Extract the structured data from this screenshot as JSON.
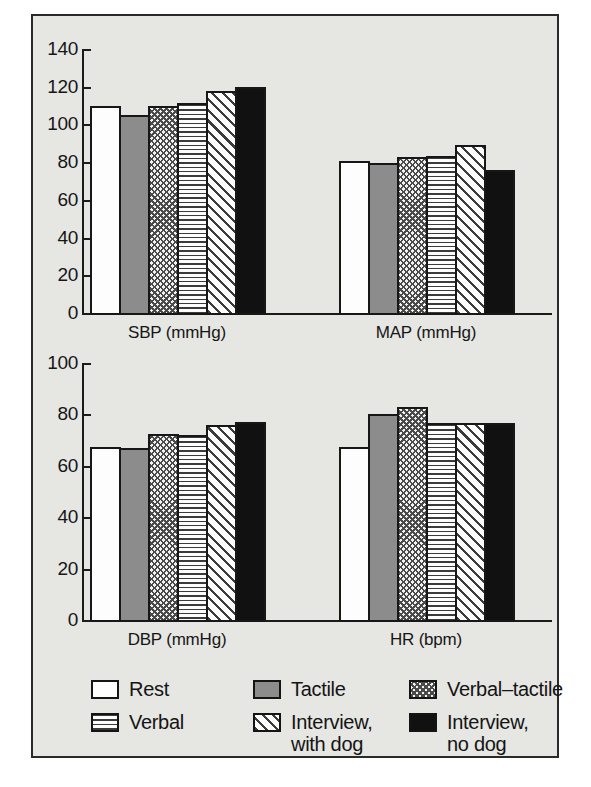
{
  "chart_data": {
    "type": "bar",
    "title": "",
    "subtitle": "",
    "grid": false,
    "legend_position": "bottom",
    "series": [
      {
        "name": "Rest",
        "pattern": "solid-white",
        "values": [
          110,
          80.5,
          67.5,
          67.5
        ]
      },
      {
        "name": "Tactile",
        "pattern": "grey",
        "values": [
          105,
          79.5,
          67,
          80
        ]
      },
      {
        "name": "Verbal–tactile",
        "pattern": "checker",
        "values": [
          110,
          82.5,
          72.5,
          83
        ]
      },
      {
        "name": "Verbal",
        "pattern": "hlines",
        "values": [
          111.5,
          83,
          72,
          76.5
        ]
      },
      {
        "name": "Interview,\nwith dog",
        "pattern": "diagonal",
        "values": [
          117.5,
          89,
          76,
          76.5
        ]
      },
      {
        "name": "Interview,\nno dog",
        "pattern": "black",
        "values": [
          120,
          76,
          77,
          76.5
        ]
      }
    ],
    "panels": [
      {
        "id": "sbp",
        "xlabel": "SBP (mmHg)",
        "ylabel": "",
        "ylim": [
          0,
          140
        ],
        "yticks": [
          "0",
          "20",
          "40",
          "60",
          "80",
          "100",
          "120",
          "140"
        ],
        "categories": [
          "Rest",
          "Tactile",
          "Verbal–tactile",
          "Verbal",
          "Interview, with dog",
          "Interview, no dog"
        ],
        "values": [
          110,
          105,
          110,
          111.5,
          117.5,
          120
        ]
      },
      {
        "id": "map",
        "xlabel": "MAP (mmHg)",
        "ylabel": "",
        "ylim": [
          0,
          140
        ],
        "yticks": [],
        "categories": [
          "Rest",
          "Tactile",
          "Verbal–tactile",
          "Verbal",
          "Interview, with dog",
          "Interview, no dog"
        ],
        "values": [
          80.5,
          79.5,
          82.5,
          83,
          89,
          76
        ]
      },
      {
        "id": "dbp",
        "xlabel": "DBP (mmHg)",
        "ylabel": "",
        "ylim": [
          0,
          100
        ],
        "yticks": [
          "0",
          "20",
          "40",
          "60",
          "80",
          "100"
        ],
        "categories": [
          "Rest",
          "Tactile",
          "Verbal–tactile",
          "Verbal",
          "Interview, with dog",
          "Interview, no dog"
        ],
        "values": [
          67.5,
          67,
          72.5,
          72,
          76,
          77
        ]
      },
      {
        "id": "hr",
        "xlabel": "HR (bpm)",
        "ylabel": "",
        "ylim": [
          0,
          100
        ],
        "yticks": [],
        "categories": [
          "Rest",
          "Tactile",
          "Verbal–tactile",
          "Verbal",
          "Interview, with dog",
          "Interview, no dog"
        ],
        "values": [
          67.5,
          80,
          83,
          76.5,
          76.5,
          76.5
        ]
      }
    ]
  },
  "axes": {
    "top": {
      "ticks": [
        "140",
        "120",
        "100",
        "80",
        "60",
        "40",
        "20",
        "0"
      ],
      "sbp_label": "SBP (mmHg)",
      "map_label": "MAP (mmHg)"
    },
    "bottom": {
      "ticks": [
        "100",
        "80",
        "60",
        "40",
        "20",
        "0"
      ],
      "dbp_label": "DBP (mmHg)",
      "hr_label": "HR (bpm)"
    }
  },
  "legend": {
    "items": [
      {
        "label": "Rest",
        "pattern": "solid-white"
      },
      {
        "label": "Tactile",
        "pattern": "grey"
      },
      {
        "label": "Verbal–tactile",
        "pattern": "checker"
      },
      {
        "label": "Verbal",
        "pattern": "hlines"
      },
      {
        "label": "Interview,\nwith dog",
        "pattern": "diagonal"
      },
      {
        "label": "Interview,\nno dog",
        "pattern": "black"
      }
    ]
  },
  "colors": {
    "background": "#ffffff",
    "plate": "#e6e6e3",
    "ink": "#161616",
    "grey_fill": "#8c8c8c",
    "black_fill": "#111111",
    "white_fill": "#fdfdfd"
  }
}
